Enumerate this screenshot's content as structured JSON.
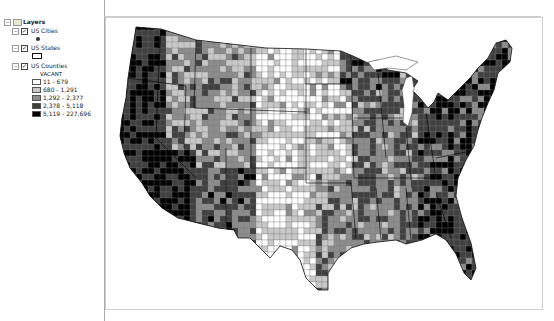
{
  "toc": {
    "root": {
      "label": "Layers",
      "expanded": true
    },
    "layers": [
      {
        "name": "US Cities",
        "checked": true,
        "symbol": "point"
      },
      {
        "name": "US States",
        "checked": true,
        "symbol": "polygon-outline"
      },
      {
        "name": "US Counties",
        "checked": true,
        "field": "VACANT",
        "classes": [
          {
            "label": "11 - 679",
            "color": "#ffffff"
          },
          {
            "label": "680 - 1,291",
            "color": "#c8c8c8"
          },
          {
            "label": "1,292 - 2,377",
            "color": "#8c8c8c"
          },
          {
            "label": "2,378 - 5,118",
            "color": "#404040"
          },
          {
            "label": "5,119 - 227,696",
            "color": "#000000"
          }
        ]
      }
    ]
  },
  "map": {
    "title": "US Counties choropleth - VACANT",
    "colors": {
      "c1": "#ffffff",
      "c2": "#c8c8c8",
      "c3": "#8c8c8c",
      "c4": "#404040",
      "c5": "#000000"
    }
  }
}
